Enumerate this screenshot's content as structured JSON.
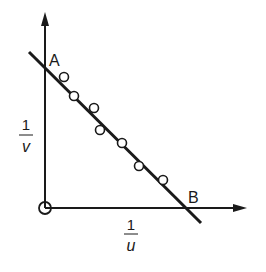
{
  "diagram": {
    "type": "linear-plot",
    "colors": {
      "ink": "#1a1a1a",
      "background": "#ffffff"
    },
    "axes": {
      "x": {
        "label_numerator": "1",
        "label_denominator": "u"
      },
      "y": {
        "label_numerator": "1",
        "label_denominator": "v"
      },
      "origin_marker": "circle"
    },
    "line": {
      "start_label": "A",
      "end_label": "B"
    },
    "data_points": [
      {
        "x": 64,
        "y": 77
      },
      {
        "x": 74,
        "y": 96
      },
      {
        "x": 94,
        "y": 108
      },
      {
        "x": 100,
        "y": 130
      },
      {
        "x": 122,
        "y": 143
      },
      {
        "x": 139,
        "y": 166
      },
      {
        "x": 163,
        "y": 180
      }
    ]
  }
}
